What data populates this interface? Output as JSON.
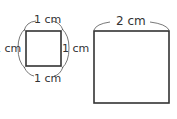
{
  "diagram": {
    "small_square": {
      "top_label": "1 cm",
      "left_label": "1 cm",
      "right_label": "1 cm",
      "bottom_label": "1 cm"
    },
    "large_square": {
      "top_label": "2 cm"
    },
    "colors": {
      "stroke": "#333333",
      "background": "#ffffff"
    }
  }
}
